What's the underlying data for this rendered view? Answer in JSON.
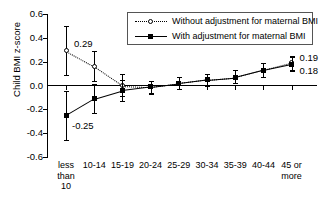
{
  "chart_data": {
    "type": "line",
    "title": "",
    "xlabel": "",
    "ylabel": "Child BMI z-score",
    "ylim": [
      -0.6,
      0.6
    ],
    "yticks": [
      "0.6",
      "0.4",
      "0.2",
      "0.0",
      "-0.2",
      "-0.4",
      "-0.6"
    ],
    "ytick_values": [
      0.6,
      0.4,
      0.2,
      0.0,
      -0.2,
      -0.4,
      -0.6
    ],
    "grid": false,
    "legend_position": "top-right",
    "categories": [
      "less\nthan\n10",
      "10-14",
      "15-19",
      "20-24",
      "25-29",
      "30-34",
      "35-39",
      "40-44",
      "45 or\nmore"
    ],
    "series": [
      {
        "name": "Without adjustment for maternal BMI",
        "marker": "open-circle",
        "line": "dotted",
        "values": [
          0.29,
          0.16,
          0.0,
          -0.01,
          0.02,
          0.05,
          0.07,
          0.13,
          0.19
        ],
        "err_low": [
          0.09,
          0.04,
          -0.09,
          -0.06,
          -0.03,
          0.0,
          0.02,
          0.07,
          0.13
        ],
        "err_high": [
          0.5,
          0.29,
          0.1,
          0.04,
          0.07,
          0.1,
          0.13,
          0.19,
          0.25
        ]
      },
      {
        "name": "With adjustment for maternal BMI",
        "marker": "filled-square",
        "line": "solid",
        "values": [
          -0.25,
          -0.11,
          -0.04,
          -0.01,
          0.02,
          0.05,
          0.07,
          0.13,
          0.18
        ],
        "err_low": [
          -0.46,
          -0.23,
          -0.13,
          -0.07,
          -0.03,
          0.0,
          0.02,
          0.07,
          0.12
        ],
        "err_high": [
          -0.05,
          0.01,
          0.05,
          0.04,
          0.07,
          0.1,
          0.13,
          0.19,
          0.24
        ]
      }
    ],
    "annotations": [
      {
        "text": "0.29",
        "series": 0,
        "index": 0
      },
      {
        "text": "-0.25",
        "series": 1,
        "index": 0
      },
      {
        "text": "0.19",
        "series": 0,
        "index": 8
      },
      {
        "text": "0.18",
        "series": 1,
        "index": 8
      }
    ]
  },
  "legend": {
    "entries": [
      "Without adjustment for maternal BMI",
      "With adjustment for maternal BMI"
    ]
  }
}
